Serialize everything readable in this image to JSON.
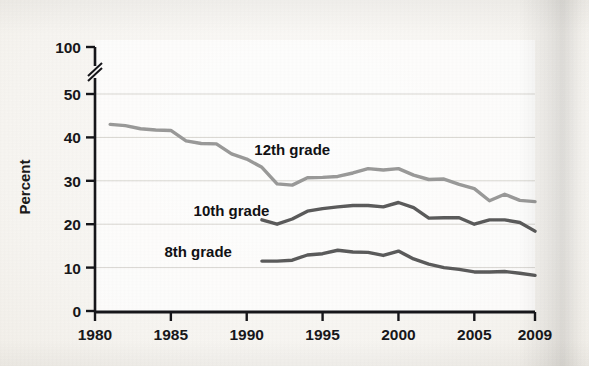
{
  "chart_data": {
    "type": "line",
    "title": "",
    "xlabel": "",
    "ylabel": "Percent",
    "xlim": [
      1980,
      2009
    ],
    "ylim": [
      0,
      50
    ],
    "y_axis_break": true,
    "y_axis_break_note": "axis broken between 50 and 100",
    "grid": "horizontal",
    "legend": "inline-labels",
    "yticks": [
      0,
      10,
      20,
      30,
      40,
      50,
      100
    ],
    "ytick_labels": [
      "0",
      "10",
      "20",
      "30",
      "40",
      "50",
      "100"
    ],
    "xticks": [
      1980,
      1985,
      1990,
      1995,
      2000,
      2005,
      2009
    ],
    "xtick_labels": [
      "1980",
      "1985",
      "1990",
      "1995",
      "2000",
      "2005",
      "2009"
    ],
    "series": [
      {
        "name": "12th grade",
        "color": "#9a9a99",
        "label_x": 1993.0,
        "label_y": 36.0,
        "x": [
          1981,
          1982,
          1983,
          1984,
          1985,
          1986,
          1987,
          1988,
          1989,
          1990,
          1991,
          1992,
          1993,
          1994,
          1995,
          1996,
          1997,
          1998,
          1999,
          2000,
          2001,
          2002,
          2003,
          2004,
          2005,
          2006,
          2007,
          2008,
          2009
        ],
        "values": [
          43.0,
          42.7,
          42.0,
          41.7,
          41.6,
          39.2,
          38.6,
          38.5,
          36.2,
          35.0,
          33.1,
          29.3,
          29.0,
          30.7,
          30.8,
          31.0,
          31.8,
          32.8,
          32.5,
          32.8,
          31.3,
          30.3,
          30.4,
          29.2,
          28.2,
          25.4,
          26.9,
          25.5,
          25.2
        ]
      },
      {
        "name": "10th grade",
        "color": "#5b5b5b",
        "label_x": 1989.0,
        "label_y": 21.8,
        "x": [
          1991,
          1992,
          1993,
          1994,
          1995,
          1996,
          1997,
          1998,
          1999,
          2000,
          2001,
          2002,
          2003,
          2004,
          2005,
          2006,
          2007,
          2008,
          2009
        ],
        "values": [
          21.0,
          20.0,
          21.2,
          23.0,
          23.6,
          24.0,
          24.3,
          24.3,
          24.0,
          25.0,
          23.8,
          21.4,
          21.5,
          21.5,
          20.0,
          21.0,
          21.0,
          20.4,
          18.4
        ]
      },
      {
        "name": "8th grade",
        "color": "#5b5b5b",
        "label_x": 1986.8,
        "label_y": 12.4,
        "x": [
          1991,
          1992,
          1993,
          1994,
          1995,
          1996,
          1997,
          1998,
          1999,
          2000,
          2001,
          2002,
          2003,
          2004,
          2005,
          2006,
          2007,
          2008,
          2009
        ],
        "values": [
          11.5,
          11.5,
          11.7,
          12.9,
          13.2,
          14.0,
          13.6,
          13.5,
          12.8,
          13.8,
          12.0,
          10.8,
          10.0,
          9.6,
          9.0,
          9.0,
          9.1,
          8.7,
          8.2
        ]
      }
    ]
  }
}
